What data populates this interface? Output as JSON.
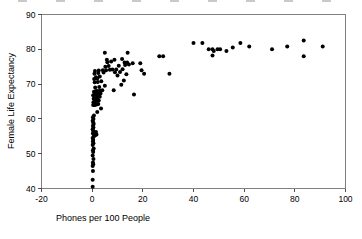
{
  "chart_data": {
    "type": "scatter",
    "title": "",
    "xlabel": "Phones per 100 People",
    "ylabel": "Female Life Expectancy",
    "xlim": [
      -20,
      100
    ],
    "ylim": [
      40,
      90
    ],
    "xticks": [
      -20,
      0,
      20,
      40,
      60,
      80,
      100
    ],
    "xtick_labels": [
      "-20",
      "0",
      "20",
      "40",
      "60",
      "80",
      "100"
    ],
    "yticks": [
      40,
      50,
      60,
      70,
      80,
      90
    ],
    "ytick_labels": [
      "40",
      "50",
      "60",
      "70",
      "80",
      "90"
    ],
    "grid": false,
    "legend": null,
    "marker": "filled-circle",
    "marker_color": "#000000",
    "marker_size": 2.0,
    "n_points": 123,
    "points": [
      [
        0.2,
        40.5
      ],
      [
        0.2,
        42.5
      ],
      [
        0.3,
        45.0
      ],
      [
        0.2,
        46.5
      ],
      [
        0.4,
        47.0
      ],
      [
        0.3,
        47.5
      ],
      [
        0.5,
        48.5
      ],
      [
        0.2,
        49.5
      ],
      [
        0.4,
        50.5
      ],
      [
        0.3,
        51.0
      ],
      [
        0.6,
        51.5
      ],
      [
        0.2,
        52.5
      ],
      [
        0.5,
        53.0
      ],
      [
        0.3,
        53.5
      ],
      [
        0.4,
        54.0
      ],
      [
        0.2,
        54.5
      ],
      [
        0.7,
        55.0
      ],
      [
        0.9,
        55.2
      ],
      [
        1.3,
        55.4
      ],
      [
        1.7,
        55.5
      ],
      [
        0.3,
        55.8
      ],
      [
        0.6,
        56.0
      ],
      [
        1.0,
        56.1
      ],
      [
        1.5,
        56.2
      ],
      [
        0.4,
        56.5
      ],
      [
        0.2,
        57.0
      ],
      [
        0.5,
        57.5
      ],
      [
        0.3,
        58.0
      ],
      [
        0.6,
        58.5
      ],
      [
        0.4,
        59.0
      ],
      [
        0.2,
        59.5
      ],
      [
        0.5,
        60.0
      ],
      [
        0.3,
        60.5
      ],
      [
        0.7,
        61.0
      ],
      [
        2.0,
        62.0
      ],
      [
        3.5,
        63.0
      ],
      [
        0.4,
        64.0
      ],
      [
        0.9,
        64.0
      ],
      [
        1.4,
        64.1
      ],
      [
        1.9,
        64.2
      ],
      [
        2.4,
        64.3
      ],
      [
        0.5,
        64.8
      ],
      [
        1.1,
        65.0
      ],
      [
        1.8,
        65.2
      ],
      [
        2.6,
        65.3
      ],
      [
        0.6,
        65.8
      ],
      [
        1.3,
        66.0
      ],
      [
        2.1,
        66.2
      ],
      [
        3.0,
        66.4
      ],
      [
        0.4,
        66.8
      ],
      [
        1.0,
        67.0
      ],
      [
        1.7,
        67.1
      ],
      [
        2.5,
        67.2
      ],
      [
        3.3,
        67.3
      ],
      [
        0.7,
        67.8
      ],
      [
        1.5,
        68.0
      ],
      [
        2.3,
        68.0
      ],
      [
        3.2,
        68.1
      ],
      [
        4.0,
        68.2
      ],
      [
        8.5,
        68.2
      ],
      [
        16.5,
        67.0
      ],
      [
        1.2,
        69.0
      ],
      [
        2.8,
        69.2
      ],
      [
        5.0,
        69.5
      ],
      [
        11.5,
        69.8
      ],
      [
        1.0,
        70.5
      ],
      [
        2.2,
        70.6
      ],
      [
        3.6,
        70.8
      ],
      [
        12.5,
        71.0
      ],
      [
        0.8,
        71.5
      ],
      [
        2.0,
        71.6
      ],
      [
        1.5,
        72.0
      ],
      [
        3.0,
        72.2
      ],
      [
        10.0,
        72.5
      ],
      [
        13.5,
        72.8
      ],
      [
        0.9,
        73.0
      ],
      [
        2.4,
        73.2
      ],
      [
        4.5,
        73.3
      ],
      [
        9.0,
        73.4
      ],
      [
        11.0,
        73.5
      ],
      [
        20.5,
        73.0
      ],
      [
        30.5,
        73.0
      ],
      [
        1.1,
        73.8
      ],
      [
        2.6,
        73.9
      ],
      [
        4.2,
        74.0
      ],
      [
        5.5,
        74.0
      ],
      [
        7.0,
        74.1
      ],
      [
        8.0,
        74.2
      ],
      [
        9.5,
        74.2
      ],
      [
        12.0,
        74.3
      ],
      [
        19.5,
        74.0
      ],
      [
        5.2,
        75.0
      ],
      [
        6.5,
        75.2
      ],
      [
        10.5,
        75.3
      ],
      [
        13.0,
        75.5
      ],
      [
        14.5,
        75.6
      ],
      [
        16.0,
        76.0
      ],
      [
        19.0,
        76.0
      ],
      [
        6.0,
        76.3
      ],
      [
        7.5,
        76.5
      ],
      [
        12.8,
        76.2
      ],
      [
        13.8,
        76.2
      ],
      [
        5.8,
        77.0
      ],
      [
        8.8,
        77.0
      ],
      [
        11.8,
        77.2
      ],
      [
        26.5,
        78.0
      ],
      [
        28.0,
        78.0
      ],
      [
        5.0,
        79.0
      ],
      [
        14.0,
        79.0
      ],
      [
        47.5,
        78.2
      ],
      [
        40.0,
        81.8
      ],
      [
        43.5,
        81.8
      ],
      [
        46.0,
        80.0
      ],
      [
        47.5,
        80.0
      ],
      [
        48.0,
        79.5
      ],
      [
        49.5,
        80.0
      ],
      [
        50.5,
        80.0
      ],
      [
        53.0,
        79.5
      ],
      [
        55.5,
        80.5
      ],
      [
        58.5,
        81.8
      ],
      [
        62.0,
        80.8
      ],
      [
        71.0,
        80.0
      ],
      [
        77.0,
        80.8
      ],
      [
        83.5,
        82.5
      ],
      [
        83.5,
        78.0
      ],
      [
        91.0,
        80.8
      ]
    ]
  },
  "axes": {
    "x_title": "Phones per 100 People",
    "y_title": "Female Life Expectancy"
  },
  "artifact": {
    "top_clipped_row_note": ""
  }
}
